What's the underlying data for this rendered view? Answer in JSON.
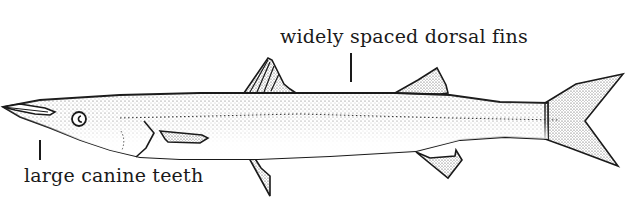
{
  "figure": {
    "labels": {
      "dorsal": "widely spaced dorsal fins",
      "teeth": "large canine teeth"
    },
    "colors": {
      "ink": "#1a1a1a",
      "stipple": "#555555",
      "background": "#ffffff"
    }
  }
}
